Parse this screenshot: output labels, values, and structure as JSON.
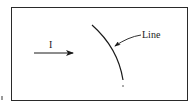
{
  "diagram": {
    "frame": {
      "x": 11,
      "y": 7,
      "width": 175,
      "height": 92,
      "stroke": "#2a2a2a"
    },
    "current_arrow": {
      "label": "I",
      "direction": "right",
      "x1": 34,
      "y1": 53,
      "x2": 73,
      "y2": 53
    },
    "curve": {
      "description": "curved line arcing from upper-left to lower point",
      "start": [
        92,
        25
      ],
      "end": [
        123,
        80
      ],
      "end_dot": [
        123,
        86
      ]
    },
    "callout": {
      "label": "Line",
      "leader_from": [
        141,
        35
      ],
      "leader_to": [
        115,
        46
      ]
    },
    "colors": {
      "ink": "#1a1a1a",
      "background": "#ffffff"
    }
  }
}
